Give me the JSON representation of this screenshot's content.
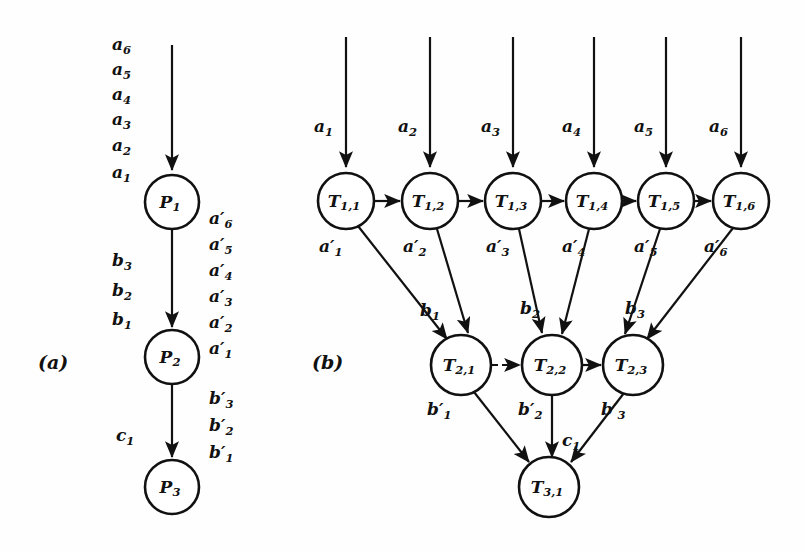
{
  "figure": {
    "panels": [
      {
        "id": "a",
        "label": "(a)",
        "label_x": 38,
        "label_y": 351
      },
      {
        "id": "b",
        "label": "(b)",
        "label_x": 312,
        "label_y": 351
      }
    ]
  },
  "panel_a": {
    "nodes": [
      {
        "name": "P",
        "sub": "1",
        "cx": 172,
        "cy": 202,
        "r": 27
      },
      {
        "name": "P",
        "sub": "2",
        "cx": 172,
        "cy": 357,
        "r": 27
      },
      {
        "name": "P",
        "sub": "3",
        "cx": 172,
        "cy": 487,
        "r": 27
      }
    ],
    "input_tokens": [
      {
        "base": "a",
        "sub": "6",
        "x": 112,
        "y": 36
      },
      {
        "base": "a",
        "sub": "5",
        "x": 112,
        "y": 61
      },
      {
        "base": "a",
        "sub": "4",
        "x": 112,
        "y": 86
      },
      {
        "base": "a",
        "sub": "3",
        "x": 112,
        "y": 111
      },
      {
        "base": "a",
        "sub": "2",
        "x": 112,
        "y": 137
      },
      {
        "base": "a",
        "sub": "1",
        "x": 112,
        "y": 164
      }
    ],
    "mid_tokens": [
      {
        "base": "b",
        "sub": "3",
        "x": 112,
        "y": 252
      },
      {
        "base": "b",
        "sub": "2",
        "x": 112,
        "y": 282
      },
      {
        "base": "b",
        "sub": "1",
        "x": 112,
        "y": 311
      }
    ],
    "low_tokens": [
      {
        "base": "c",
        "sub": "1",
        "x": 116,
        "y": 427
      }
    ],
    "out_tokens_upper": [
      {
        "base": "a",
        "prime": true,
        "sub": "6",
        "x": 209,
        "y": 210
      },
      {
        "base": "a",
        "prime": true,
        "sub": "5",
        "x": 209,
        "y": 236
      },
      {
        "base": "a",
        "prime": true,
        "sub": "4",
        "x": 209,
        "y": 262
      },
      {
        "base": "a",
        "prime": true,
        "sub": "3",
        "x": 209,
        "y": 288
      },
      {
        "base": "a",
        "prime": true,
        "sub": "2",
        "x": 209,
        "y": 314
      },
      {
        "base": "a",
        "prime": true,
        "sub": "1",
        "x": 209,
        "y": 340
      }
    ],
    "out_tokens_lower": [
      {
        "base": "b",
        "prime": true,
        "sub": "3",
        "x": 209,
        "y": 390
      },
      {
        "base": "b",
        "prime": true,
        "sub": "2",
        "x": 209,
        "y": 417
      },
      {
        "base": "b",
        "prime": true,
        "sub": "1",
        "x": 209,
        "y": 444
      }
    ],
    "edges": [
      {
        "name": "input-arrow-to-p1",
        "x1": 172,
        "y1": 45,
        "x2": 172,
        "y2": 170,
        "style": "solid"
      },
      {
        "name": "p1-to-p2",
        "x1": 172,
        "y1": 229,
        "x2": 172,
        "y2": 327,
        "style": "solid"
      },
      {
        "name": "p2-to-p3",
        "x1": 172,
        "y1": 384,
        "x2": 172,
        "y2": 457,
        "style": "solid"
      }
    ]
  },
  "panel_b": {
    "row1": {
      "nodes": [
        {
          "name": "T",
          "sub": "1,1",
          "cx": 346,
          "cy": 201,
          "r": 28
        },
        {
          "name": "T",
          "sub": "1,2",
          "cx": 430,
          "cy": 201,
          "r": 28
        },
        {
          "name": "T",
          "sub": "1,3",
          "cx": 513,
          "cy": 201,
          "r": 28
        },
        {
          "name": "T",
          "sub": "1,4",
          "cx": 594,
          "cy": 201,
          "r": 28
        },
        {
          "name": "T",
          "sub": "1,5",
          "cx": 666,
          "cy": 201,
          "r": 28
        },
        {
          "name": "T",
          "sub": "1,6",
          "cx": 741,
          "cy": 201,
          "r": 28
        }
      ],
      "input_tokens": [
        {
          "base": "a",
          "sub": "1",
          "x": 314,
          "y": 118
        },
        {
          "base": "a",
          "sub": "2",
          "x": 398,
          "y": 118
        },
        {
          "base": "a",
          "sub": "3",
          "x": 481,
          "y": 118
        },
        {
          "base": "a",
          "sub": "4",
          "x": 562,
          "y": 118
        },
        {
          "base": "a",
          "sub": "5",
          "x": 634,
          "y": 118
        },
        {
          "base": "a",
          "sub": "6",
          "x": 709,
          "y": 118
        }
      ],
      "output_tokens": [
        {
          "base": "a",
          "prime": true,
          "sub": "1",
          "x": 319,
          "y": 238
        },
        {
          "base": "a",
          "prime": true,
          "sub": "2",
          "x": 403,
          "y": 238
        },
        {
          "base": "a",
          "prime": true,
          "sub": "3",
          "x": 486,
          "y": 238
        },
        {
          "base": "a",
          "prime": true,
          "sub": "4",
          "x": 562,
          "y": 238
        },
        {
          "base": "a",
          "prime": true,
          "sub": "5",
          "x": 634,
          "y": 238
        },
        {
          "base": "a",
          "prime": true,
          "sub": "6",
          "x": 704,
          "y": 238
        }
      ]
    },
    "row2": {
      "nodes": [
        {
          "name": "T",
          "sub": "2,1",
          "cx": 461,
          "cy": 365,
          "r": 30
        },
        {
          "name": "T",
          "sub": "2,2",
          "cx": 552,
          "cy": 365,
          "r": 30
        },
        {
          "name": "T",
          "sub": "2,3",
          "cx": 633,
          "cy": 365,
          "r": 30
        }
      ],
      "input_tokens": [
        {
          "base": "b",
          "sub": "1",
          "x": 420,
          "y": 302
        },
        {
          "base": "b",
          "sub": "2",
          "x": 520,
          "y": 300
        },
        {
          "base": "b",
          "sub": "3",
          "x": 625,
          "y": 300
        }
      ],
      "output_tokens": [
        {
          "base": "b",
          "prime": true,
          "sub": "1",
          "x": 427,
          "y": 401
        },
        {
          "base": "b",
          "prime": true,
          "sub": "2",
          "x": 518,
          "y": 401
        },
        {
          "base": "b",
          "prime": true,
          "sub": "3",
          "x": 601,
          "y": 401
        }
      ]
    },
    "row3": {
      "nodes": [
        {
          "name": "T",
          "sub": "3,1",
          "cx": 549,
          "cy": 487,
          "r": 30
        }
      ],
      "input_tokens": [
        {
          "base": "c",
          "sub": "1",
          "x": 562,
          "y": 432
        }
      ]
    },
    "vertical_inputs": [
      {
        "name": "input-arrow-t11",
        "x": 346,
        "y1": 37,
        "y2": 167
      },
      {
        "name": "input-arrow-t12",
        "x": 430,
        "y1": 37,
        "y2": 167
      },
      {
        "name": "input-arrow-t13",
        "x": 513,
        "y1": 37,
        "y2": 167
      },
      {
        "name": "input-arrow-t14",
        "x": 594,
        "y1": 37,
        "y2": 167
      },
      {
        "name": "input-arrow-t15",
        "x": 666,
        "y1": 37,
        "y2": 167
      },
      {
        "name": "input-arrow-t16",
        "x": 741,
        "y1": 37,
        "y2": 167
      }
    ],
    "chain_row1": [
      {
        "name": "t11-to-t12",
        "x1": 374,
        "x2": 400,
        "y": 201,
        "style": "solid"
      },
      {
        "name": "t12-to-t13",
        "x1": 458,
        "x2": 483,
        "y": 201,
        "style": "solid"
      },
      {
        "name": "t13-to-t14",
        "x1": 541,
        "x2": 564,
        "y": 201,
        "style": "solid"
      },
      {
        "name": "t14-to-t15",
        "x1": 622,
        "x2": 636,
        "y": 201,
        "style": "solid"
      },
      {
        "name": "t15-to-t16",
        "x1": 694,
        "x2": 711,
        "y": 201,
        "style": "solid"
      }
    ],
    "chain_row2": [
      {
        "name": "t21-to-t22",
        "x1": 492,
        "x2": 520,
        "y": 365,
        "style": "dashed"
      },
      {
        "name": "t22-to-t23",
        "x1": 583,
        "x2": 601,
        "y": 365,
        "style": "solid"
      }
    ],
    "diagonals_row1_to_row2": [
      {
        "name": "t11-to-t21",
        "x1": 358,
        "y1": 226,
        "x2": 447,
        "y2": 339
      },
      {
        "name": "t12-to-t21",
        "x1": 437,
        "y1": 229,
        "x2": 468,
        "y2": 333
      },
      {
        "name": "t13-to-t22",
        "x1": 519,
        "y1": 229,
        "x2": 542,
        "y2": 333
      },
      {
        "name": "t14-to-t22",
        "x1": 589,
        "y1": 229,
        "x2": 562,
        "y2": 334
      },
      {
        "name": "t15-to-t23",
        "x1": 660,
        "y1": 229,
        "x2": 625,
        "y2": 334
      },
      {
        "name": "t16-to-t23",
        "x1": 733,
        "y1": 228,
        "x2": 647,
        "y2": 339
      }
    ],
    "diagonals_row2_to_row3": [
      {
        "name": "t21-to-t31",
        "x1": 474,
        "y1": 392,
        "x2": 529,
        "y2": 462
      },
      {
        "name": "t22-to-t31",
        "x1": 552,
        "y1": 395,
        "x2": 552,
        "y2": 457
      },
      {
        "name": "t23-to-t31",
        "x1": 624,
        "y1": 393,
        "x2": 571,
        "y2": 462
      }
    ]
  },
  "colors": {
    "ink": "#111111",
    "paper": "#fefefe"
  }
}
